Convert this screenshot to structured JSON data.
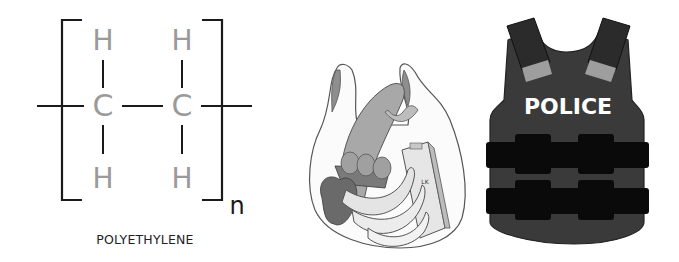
{
  "formula": {
    "atoms": {
      "h_top_left": "H",
      "h_top_right": "H",
      "c_left": "C",
      "c_right": "C",
      "h_bottom_left": "H",
      "h_bottom_right": "H"
    },
    "subscript": "n",
    "caption": "POLYETHYLENE",
    "colors": {
      "atom": "#9a9a9a",
      "bond": "#1a1a1a"
    }
  },
  "bag": {
    "carton_label": "LK"
  },
  "vest": {
    "label": "POLICE",
    "colors": {
      "body": "#3a3a3a",
      "strap": "#0a0a0a",
      "patch": "#9e9e9e",
      "text": "#ffffff"
    }
  }
}
